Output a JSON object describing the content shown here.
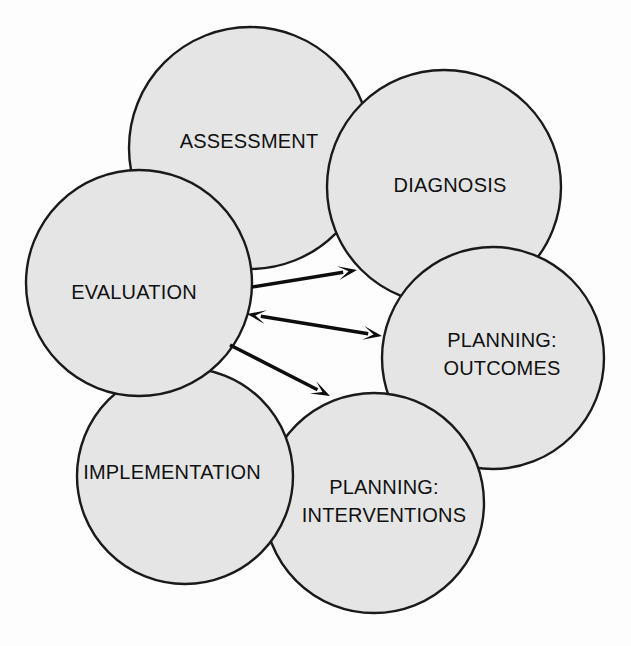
{
  "diagram": {
    "type": "overlapping-circles-venn-cycle",
    "background_color": "#fdfdfd",
    "circle_fill_color": "#e5e5e5",
    "circle_stroke_color": "#1a1a1a",
    "overlap_fill_color": "#b3b3b3",
    "arrow_color": "#0d0d0d",
    "label_color": "#111111",
    "nodes": [
      {
        "id": "assessment",
        "label": "ASSESSMENT",
        "label_lines": [
          "ASSESSMENT"
        ],
        "cx": 250,
        "cy": 148,
        "r": 121,
        "label_x": 249,
        "label_y": 143
      },
      {
        "id": "diagnosis",
        "label": "DIAGNOSIS",
        "label_lines": [
          "DIAGNOSIS"
        ],
        "cx": 444,
        "cy": 187,
        "r": 117,
        "label_x": 450,
        "label_y": 187
      },
      {
        "id": "planning-outcomes",
        "label": "PLANNING: OUTCOMES",
        "label_lines": [
          "PLANNING:",
          "OUTCOMES"
        ],
        "cx": 493,
        "cy": 358,
        "r": 111,
        "label_x": 502,
        "label_y": 356
      },
      {
        "id": "planning-interventions",
        "label": "PLANNING: INTERVENTIONS",
        "label_lines": [
          "PLANNING:",
          "INTERVENTIONS"
        ],
        "cx": 374,
        "cy": 503,
        "r": 110,
        "label_x": 384,
        "label_y": 503
      },
      {
        "id": "implementation",
        "label": "IMPLEMENTATION",
        "label_lines": [
          "IMPLEMENTATION"
        ],
        "cx": 185,
        "cy": 476,
        "r": 108,
        "label_x": 172,
        "label_y": 474
      },
      {
        "id": "evaluation",
        "label": "EVALUATION",
        "label_lines": [
          "EVALUATION"
        ],
        "cx": 139,
        "cy": 283,
        "r": 113,
        "label_x": 134,
        "label_y": 294
      }
    ],
    "overlaps": [
      {
        "id": "assessment-evaluation",
        "a": "assessment",
        "b": "evaluation"
      },
      {
        "id": "assessment-diagnosis",
        "a": "assessment",
        "b": "diagnosis"
      },
      {
        "id": "diagnosis-planning-outcomes",
        "a": "diagnosis",
        "b": "planning-outcomes"
      },
      {
        "id": "planning-outcomes-planning-interventions",
        "a": "planning-outcomes",
        "b": "planning-interventions"
      },
      {
        "id": "planning-interventions-implementation",
        "a": "planning-interventions",
        "b": "implementation"
      },
      {
        "id": "implementation-evaluation",
        "a": "implementation",
        "b": "evaluation"
      }
    ],
    "arrows": [
      {
        "id": "evaluation-to-diagnosis",
        "from": "evaluation",
        "to": "diagnosis",
        "x1": 252,
        "y1": 287,
        "x2": 357,
        "y2": 270,
        "direction": "one-way"
      },
      {
        "id": "evaluation-to-planning-outcomes",
        "from": "evaluation",
        "to": "planning-outcomes",
        "x1": 247,
        "y1": 314,
        "x2": 382,
        "y2": 336,
        "direction": "two-way"
      },
      {
        "id": "evaluation-to-planning-interventions",
        "from": "evaluation",
        "to": "planning-interventions",
        "x1": 230,
        "y1": 345,
        "x2": 330,
        "y2": 396,
        "direction": "one-way"
      }
    ]
  }
}
